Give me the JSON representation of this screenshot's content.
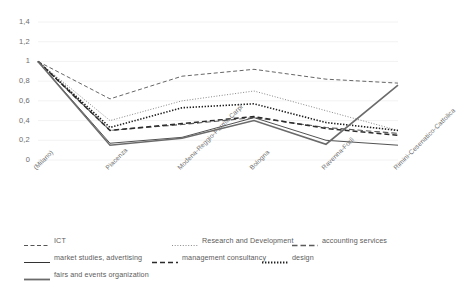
{
  "chart_data": {
    "type": "line",
    "title": "",
    "xlabel": "",
    "ylabel": "",
    "ylim": [
      0,
      1.4
    ],
    "grid": true,
    "legend_position": "bottom",
    "categories": [
      "(Milano)",
      "Piacenza",
      "Modena-Reggio-Parma-Carpi",
      "Bologna",
      "Ravenna-Forlì",
      "Rimini-Cesenatico-Cattolica"
    ],
    "yticks": [
      "0",
      "0,2",
      "0,4",
      "0,6",
      "0,8",
      "1",
      "1,2",
      "1,4"
    ],
    "ytick_values": [
      0,
      0.2,
      0.4,
      0.6,
      0.8,
      1.0,
      1.2,
      1.4
    ],
    "series": [
      {
        "name": "ICT",
        "style": "dashed",
        "color": "#555555",
        "values": [
          1.0,
          0.62,
          0.85,
          0.92,
          0.82,
          0.78
        ]
      },
      {
        "name": "Research and Development",
        "style": "dotted",
        "color": "#8a8a8a",
        "values": [
          1.0,
          0.4,
          0.6,
          0.7,
          0.5,
          0.3
        ]
      },
      {
        "name": "accounting services",
        "style": "dashed-long",
        "color": "#5a5a5a",
        "values": [
          1.0,
          0.3,
          0.36,
          0.43,
          0.33,
          0.27
        ]
      },
      {
        "name": "market studies, advertising",
        "style": "solid-thin",
        "color": "#333333",
        "values": [
          1.0,
          0.17,
          0.23,
          0.43,
          0.2,
          0.15
        ]
      },
      {
        "name": "management consultancy",
        "style": "dash-dash",
        "color": "#2b2b2b",
        "values": [
          1.0,
          0.3,
          0.37,
          0.44,
          0.32,
          0.25
        ]
      },
      {
        "name": "design",
        "style": "dotted-bold",
        "color": "#1f1f1f",
        "values": [
          1.0,
          0.33,
          0.53,
          0.57,
          0.38,
          0.3
        ]
      },
      {
        "name": "fairs and events organization",
        "style": "solid-gray",
        "color": "#6b6b6b",
        "values": [
          1.0,
          0.15,
          0.22,
          0.4,
          0.16,
          0.76
        ]
      }
    ]
  },
  "legend": {
    "rows": [
      [
        {
          "label": "ICT",
          "style": "dashed"
        },
        {
          "label": "Research and Development",
          "style": "dotted"
        },
        {
          "label": "accounting services",
          "style": "dashed-long"
        }
      ],
      [
        {
          "label": "market studies, advertising",
          "style": "solid-thin"
        },
        {
          "label": "management consultancy",
          "style": "dash-dash"
        },
        {
          "label": "design",
          "style": "dotted-bold"
        }
      ],
      [
        {
          "label": "fairs and events organization",
          "style": "solid-gray"
        }
      ]
    ]
  }
}
